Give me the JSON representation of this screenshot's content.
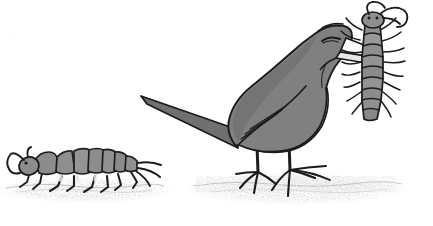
{
  "artwork": {
    "title": "Bird eating a centipede",
    "medium": "pen-and-ink line drawing with gray wash",
    "background_color": "#ffffff",
    "canvas": {
      "width": 433,
      "height": 226
    },
    "palette": {
      "ink": "#1a1a1a",
      "body_gray": "#808080",
      "mid_gray": "#8c8c8c",
      "dark_gray": "#5a5a5a",
      "light_gray": "#c9c9c9",
      "belly_white": "#f7f7f7",
      "ground_gray": "#b8b8b8",
      "shadow_gray": "#9a9a9a"
    },
    "subjects": [
      {
        "name": "bird",
        "description": "Side view of a long-tailed songbird standing on the ground, facing right, head lowered, closed eye, holding a centipede crosswise in its beak",
        "fill": "#808080",
        "belly_fill": "#f7f7f7",
        "outline": "#1a1a1a",
        "parts": [
          "head",
          "closed-eye",
          "beak",
          "body",
          "wing",
          "tail",
          "left-leg",
          "right-leg",
          "feet"
        ]
      },
      {
        "name": "centipede-in-beak",
        "description": "Segmented centipede held in the bird's beak, body hanging downward, many legs on both sides, two long antennae curling up and to the right",
        "fill": "#8c8c8c",
        "outline": "#1a1a1a",
        "segment_count": 9
      },
      {
        "name": "ground-insect",
        "description": "Segmented larva or silverfish-like insect walking left along the ground at lower left, with a curled antenna at its head and six legs",
        "fill": "#8c8c8c",
        "outline": "#1a1a1a",
        "segment_count": 9
      },
      {
        "name": "ground",
        "description": "Two patches of stippled gray soil texture, one under the insect at left and one under the bird at right",
        "fill": "#b8b8b8"
      }
    ]
  }
}
